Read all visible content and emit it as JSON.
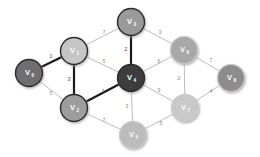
{
  "figure": {
    "background": "#ffffff",
    "highlight_color": "#1a1a1a",
    "normal_edge_color": "#bdbdbd",
    "weight_label_color": "#8a8a8a"
  },
  "chart_data": {
    "type": "diagram",
    "diagram_kind": "weighted-undirected-graph",
    "title": "",
    "nodes": [
      {
        "id": "V0",
        "label": "V",
        "sub": "0",
        "x": 29,
        "y": 73,
        "r": 13.5,
        "fill": "#6e6e6e",
        "ring": "dark"
      },
      {
        "id": "V1",
        "label": "V",
        "sub": "1",
        "x": 74,
        "y": 51,
        "r": 13.5,
        "fill": "#c6c6c6",
        "ring": "dark"
      },
      {
        "id": "V2",
        "label": "V",
        "sub": "2",
        "x": 74,
        "y": 108,
        "r": 13.5,
        "fill": "#9d9d9d",
        "ring": "dark"
      },
      {
        "id": "V3",
        "label": "V",
        "sub": "3",
        "x": 131,
        "y": 22,
        "r": 13.5,
        "fill": "#9a9a9a",
        "ring": "dark"
      },
      {
        "id": "V4",
        "label": "V",
        "sub": "4",
        "x": 131,
        "y": 78,
        "r": 13.5,
        "fill": "#3c3c3c",
        "ring": "dark"
      },
      {
        "id": "V5",
        "label": "V",
        "sub": "5",
        "x": 133,
        "y": 135,
        "r": 13.5,
        "fill": "#bcbcbc",
        "ring": "light"
      },
      {
        "id": "V6",
        "label": "V",
        "sub": "6",
        "x": 184,
        "y": 50,
        "r": 13.5,
        "fill": "#a8a8a8",
        "ring": "light"
      },
      {
        "id": "V7",
        "label": "V",
        "sub": "7",
        "x": 185,
        "y": 108,
        "r": 13.5,
        "fill": "#c9c9c9",
        "ring": "light"
      },
      {
        "id": "V8",
        "label": "V",
        "sub": "8",
        "x": 231,
        "y": 78,
        "r": 13.5,
        "fill": "#8d8d8d",
        "ring": "light"
      }
    ],
    "edges": [
      {
        "from": "V0",
        "to": "V1",
        "weight": "1",
        "highlighted": true,
        "lx": 51,
        "ly": 57
      },
      {
        "from": "V0",
        "to": "V2",
        "weight": "5",
        "highlighted": false,
        "lx": 51,
        "ly": 94
      },
      {
        "from": "V1",
        "to": "V3",
        "weight": "7",
        "highlighted": false,
        "lx": 104,
        "ly": 33
      },
      {
        "from": "V1",
        "to": "V2",
        "weight": "3",
        "highlighted": true,
        "lx": 69,
        "ly": 80
      },
      {
        "from": "V1",
        "to": "V4",
        "weight": "5",
        "highlighted": false,
        "lx": 104,
        "ly": 62
      },
      {
        "from": "V2",
        "to": "V4",
        "weight": "1",
        "highlighted": true,
        "lx": 103,
        "ly": 92
      },
      {
        "from": "V2",
        "to": "V5",
        "weight": "7",
        "highlighted": false,
        "lx": 104,
        "ly": 121
      },
      {
        "from": "V3",
        "to": "V4",
        "weight": "2",
        "highlighted": true,
        "lx": 126,
        "ly": 50
      },
      {
        "from": "V3",
        "to": "V6",
        "weight": "3",
        "highlighted": false,
        "lx": 160,
        "ly": 33
      },
      {
        "from": "V4",
        "to": "V6",
        "weight": "6",
        "highlighted": false,
        "lx": 159,
        "ly": 62
      },
      {
        "from": "V4",
        "to": "V5",
        "weight": "3",
        "highlighted": false,
        "lx": 127,
        "ly": 107
      },
      {
        "from": "V4",
        "to": "V7",
        "weight": "9",
        "highlighted": false,
        "lx": 159,
        "ly": 91
      },
      {
        "from": "V5",
        "to": "V7",
        "weight": "5",
        "highlighted": false,
        "lx": 161,
        "ly": 124
      },
      {
        "from": "V6",
        "to": "V7",
        "weight": "2",
        "highlighted": false,
        "lx": 179,
        "ly": 79
      },
      {
        "from": "V6",
        "to": "V8",
        "weight": "7",
        "highlighted": false,
        "lx": 211,
        "ly": 61
      },
      {
        "from": "V7",
        "to": "V8",
        "weight": "4",
        "highlighted": false,
        "lx": 211,
        "ly": 92
      }
    ]
  }
}
